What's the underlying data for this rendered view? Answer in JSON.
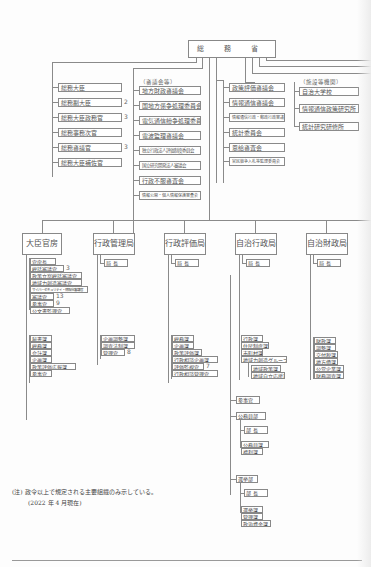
{
  "top": {
    "label": "総 務 省"
  },
  "ministers": [
    {
      "label": "総務大臣",
      "count": ""
    },
    {
      "label": "総務副大臣",
      "count": "2"
    },
    {
      "label": "総務大臣政務官",
      "count": "3"
    },
    {
      "label": "総務事務次官",
      "count": ""
    },
    {
      "label": "総務審議官",
      "count": "3"
    },
    {
      "label": "総務大臣補佐官",
      "count": ""
    }
  ],
  "councils": {
    "heading": "（審議会等）",
    "items": [
      "地方財政審議会",
      "国地方係争処理委員会",
      "電気通信紛争処理委員会",
      "電波監理審議会",
      "独立行政法人評価制度委員会",
      "国立研究開発法人審議会",
      "行政不服審査会",
      "情報公開・個人情報保護審査会"
    ]
  },
  "councils2": {
    "items": [
      "政策評価審議会",
      "情報通信審議会",
      "情報通信行政・郵政行政審議会",
      "統計委員会",
      "恩給審査会",
      "官民競争入札等監理委員会"
    ]
  },
  "facilities": {
    "heading": "（施設等機関）",
    "items": [
      "自治大学校",
      "情報通信政策研究所",
      "統計研究研修所"
    ]
  },
  "bureaus": [
    {
      "name": "大臣官房",
      "head": "",
      "sections": [
        {
          "label": "官房長",
          "count": ""
        },
        {
          "label": "総括審議官",
          "count": "3"
        },
        {
          "label": "政策立案総括審議官",
          "count": ""
        },
        {
          "label": "地域力創造審議官",
          "count": ""
        },
        {
          "label": "サイバーセキュリティ・情報化審議官",
          "count": ""
        },
        {
          "label": "審議官",
          "count": "13"
        },
        {
          "label": "参事官",
          "count": "9"
        },
        {
          "label": "公文書監理官",
          "count": ""
        }
      ],
      "divisions": [
        {
          "label": "秘書課",
          "count": ""
        },
        {
          "label": "総務課",
          "count": ""
        },
        {
          "label": "会計課",
          "count": ""
        },
        {
          "label": "企画課",
          "count": ""
        },
        {
          "label": "政策評価広報課",
          "count": ""
        },
        {
          "label": "参事官",
          "count": ""
        }
      ]
    },
    {
      "name": "行政管理局",
      "head": "局 長",
      "divisions": [
        {
          "label": "企画調整課",
          "count": ""
        },
        {
          "label": "調査法制課",
          "count": ""
        },
        {
          "label": "管理官",
          "count": "8"
        }
      ]
    },
    {
      "name": "行政評価局",
      "head": "局 長",
      "divisions": [
        {
          "label": "総務課",
          "count": ""
        },
        {
          "label": "企画課",
          "count": ""
        },
        {
          "label": "政策評価課",
          "count": ""
        },
        {
          "label": "行政相談企画課",
          "count": ""
        },
        {
          "label": "評価監視官",
          "count": "7"
        },
        {
          "label": "行政相談管理官",
          "count": ""
        }
      ]
    },
    {
      "name": "自治行政局",
      "head": "局 長",
      "divisions": [
        {
          "label": "行政課",
          "count": ""
        },
        {
          "label": "住民制度課",
          "count": ""
        },
        {
          "label": "市町村課",
          "count": ""
        },
        {
          "label": "地域力創造グループ",
          "count": ""
        }
      ],
      "sub_divisions": [
        "地域政策課",
        "地域自立応援課"
      ],
      "extra": "参事官",
      "departments": [
        {
          "name": "公務員部",
          "head": "部 長",
          "divisions": [
            "公務員課",
            "福利課"
          ]
        },
        {
          "name": "選挙部",
          "head": "部 長",
          "divisions": [
            "選挙課",
            "管理課",
            "政治資金課"
          ]
        }
      ]
    },
    {
      "name": "自治財政局",
      "head": "局 長",
      "divisions": [
        {
          "label": "財政課",
          "count": ""
        },
        {
          "label": "調整課",
          "count": ""
        },
        {
          "label": "交付税課",
          "count": ""
        },
        {
          "label": "地方債課",
          "count": ""
        },
        {
          "label": "公営企業課",
          "count": ""
        },
        {
          "label": "財務調査課",
          "count": ""
        }
      ]
    }
  ],
  "notes": {
    "line1": "(注) 政令以上で規定される主要組織のみ示している。",
    "line2": "(2022 年 4 月現在)"
  }
}
